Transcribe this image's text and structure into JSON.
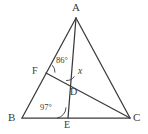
{
  "figure": {
    "type": "geometry-diagram",
    "background_color": "#ffffff",
    "stroke_color": "#3a3a3a",
    "label_color": "#3a3a3a",
    "vertices": [
      {
        "name": "A",
        "label": "A",
        "x": 76,
        "y": 18,
        "label_x": 72,
        "label_y": 2
      },
      {
        "name": "B",
        "label": "B",
        "x": 22,
        "y": 118,
        "label_x": 8,
        "label_y": 112
      },
      {
        "name": "C",
        "label": "C",
        "x": 130,
        "y": 118,
        "label_x": 133,
        "label_y": 112
      },
      {
        "name": "D",
        "label": "D",
        "x": 73,
        "y": 85,
        "label_x": 70,
        "label_y": 87
      },
      {
        "name": "E",
        "label": "E",
        "x": 68,
        "y": 118,
        "label_x": 64,
        "label_y": 120
      },
      {
        "name": "F",
        "label": "F",
        "x": 46,
        "y": 73,
        "label_x": 32,
        "label_y": 66
      }
    ],
    "segments": [
      {
        "name": "segment-AB",
        "from": "A",
        "to": "B"
      },
      {
        "name": "segment-AC",
        "from": "A",
        "to": "C"
      },
      {
        "name": "segment-BC",
        "from": "B",
        "to": "C"
      },
      {
        "name": "segment-AE",
        "from": "A",
        "to": "E"
      },
      {
        "name": "segment-FC",
        "from": "F",
        "to": "C"
      }
    ],
    "angles": [
      {
        "name": "angle-at-F",
        "vertex": "F",
        "value": "86°",
        "label_x": 56,
        "label_y": 56,
        "arc": "M 52.5,65.5 A 9,9 0 0 1 55.0,72.2"
      },
      {
        "name": "angle-at-D",
        "vertex": "D",
        "value": "x",
        "label_x": 78,
        "label_y": 67,
        "arc": "M 66.5,80.5 A 8.5,8.5 0 0 0 74.2,76.6"
      },
      {
        "name": "angle-at-E",
        "vertex": "E",
        "value": "97°",
        "label_x": 40,
        "label_y": 103,
        "arc": "M 57.5,118 A 10.5,10.5 0 0 0 66.0,107.7"
      }
    ]
  }
}
